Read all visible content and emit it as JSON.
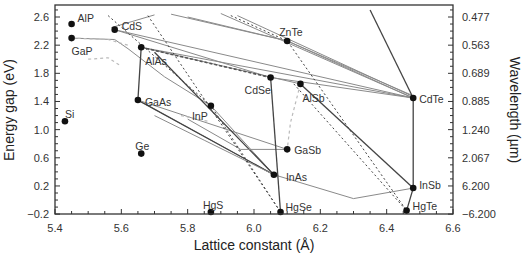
{
  "chart_data": {
    "type": "scatter",
    "title": "",
    "xlabel": "Lattice constant (Å)",
    "ylabel": "Energy gap (eV)",
    "y2label": "Wavelength (µm)",
    "xlim": [
      5.4,
      6.6
    ],
    "ylim": [
      -0.2,
      2.7
    ],
    "grid": false,
    "legend": "none",
    "x_ticks": [
      5.4,
      5.6,
      5.8,
      6.0,
      6.2,
      6.4,
      6.6
    ],
    "x_tick_labels": [
      "5.4",
      "5.6",
      "5.8",
      "6.0",
      "6.2",
      "6.4",
      "6.6"
    ],
    "y_ticks": [
      2.6,
      2.2,
      1.8,
      1.4,
      1.0,
      0.6,
      0.2,
      -0.2
    ],
    "y_tick_labels": [
      "2.6",
      "2.2",
      "1.8",
      "1.4",
      "1.0",
      "0.6",
      "0.2",
      "−0.2"
    ],
    "y2_tick_labels": [
      "0.477",
      "0.563",
      "0.689",
      "0.885",
      "1.240",
      "2.067",
      "6.200",
      "−6.200"
    ],
    "points": [
      {
        "name": "AlP",
        "x": 5.45,
        "y": 2.5,
        "lx": 6,
        "ly": -6
      },
      {
        "name": "GaP",
        "x": 5.45,
        "y": 2.3,
        "lx": 0,
        "ly": 13
      },
      {
        "name": "Si",
        "x": 5.43,
        "y": 1.12,
        "lx": 0,
        "ly": -7
      },
      {
        "name": "CdS",
        "x": 5.58,
        "y": 2.42,
        "lx": 7,
        "ly": -4
      },
      {
        "name": "AlAs",
        "x": 5.66,
        "y": 2.17,
        "lx": 4,
        "ly": 14
      },
      {
        "name": "GaAs",
        "x": 5.65,
        "y": 1.42,
        "lx": 7,
        "ly": 2
      },
      {
        "name": "Ge",
        "x": 5.66,
        "y": 0.66,
        "lx": -6,
        "ly": -8
      },
      {
        "name": "InP",
        "x": 5.87,
        "y": 1.34,
        "lx": -19,
        "ly": 10
      },
      {
        "name": "ZnTe",
        "x": 6.1,
        "y": 2.26,
        "lx": -8,
        "ly": -9
      },
      {
        "name": "CdSe",
        "x": 6.05,
        "y": 1.74,
        "lx": -26,
        "ly": 12
      },
      {
        "name": "AlSb",
        "x": 6.14,
        "y": 1.65,
        "lx": 2,
        "ly": 14
      },
      {
        "name": "CdTe",
        "x": 6.48,
        "y": 1.45,
        "lx": 6,
        "ly": 1
      },
      {
        "name": "GaSb",
        "x": 6.1,
        "y": 0.72,
        "lx": 7,
        "ly": 1
      },
      {
        "name": "InAs",
        "x": 6.06,
        "y": 0.36,
        "lx": 12,
        "ly": 2
      },
      {
        "name": "InSb",
        "x": 6.48,
        "y": 0.17,
        "lx": 6,
        "ly": -3
      },
      {
        "name": "HgS",
        "x": 5.87,
        "y": -0.17,
        "lx": -8,
        "ly": -7
      },
      {
        "name": "HgSe",
        "x": 6.08,
        "y": -0.17,
        "lx": 5,
        "ly": -5
      },
      {
        "name": "HgTe",
        "x": 6.46,
        "y": -0.15,
        "lx": 6,
        "ly": -5
      }
    ],
    "lines": [
      {
        "style": "solid-gray",
        "pts": [
          [
            5.58,
            2.42
          ],
          [
            6.05,
            1.74
          ]
        ]
      },
      {
        "style": "solid-gray",
        "pts": [
          [
            5.58,
            2.42
          ],
          [
            6.48,
            1.45
          ]
        ]
      },
      {
        "style": "solid-gray",
        "pts": [
          [
            5.57,
            2.45
          ],
          [
            5.7,
            2.63
          ]
        ]
      },
      {
        "style": "solid-gray",
        "pts": [
          [
            5.75,
            2.64
          ],
          [
            6.1,
            2.26
          ]
        ]
      },
      {
        "style": "solid-gray",
        "pts": [
          [
            5.8,
            2.6
          ],
          [
            6.1,
            2.26
          ]
        ]
      },
      {
        "style": "solid-gray",
        "pts": [
          [
            5.9,
            2.65
          ],
          [
            6.48,
            1.45
          ]
        ]
      },
      {
        "style": "solid-gray",
        "pts": [
          [
            5.95,
            2.62
          ],
          [
            6.48,
            1.47
          ]
        ]
      },
      {
        "style": "solid-gray",
        "pts": [
          [
            6.1,
            2.26
          ],
          [
            6.48,
            1.45
          ]
        ]
      },
      {
        "style": "solid-gray",
        "pts": [
          [
            6.1,
            2.26
          ],
          [
            6.48,
            1.48
          ]
        ]
      },
      {
        "style": "solid-gray",
        "pts": [
          [
            5.66,
            2.17
          ],
          [
            6.48,
            1.45
          ]
        ]
      },
      {
        "style": "solid-gray",
        "pts": [
          [
            5.66,
            2.17
          ],
          [
            6.14,
            1.65
          ]
        ]
      },
      {
        "style": "solid-gray",
        "pts": [
          [
            6.05,
            1.74
          ],
          [
            6.48,
            1.45
          ]
        ]
      },
      {
        "style": "dashed-dark",
        "pts": [
          [
            5.66,
            2.17
          ],
          [
            6.05,
            1.74
          ]
        ]
      },
      {
        "style": "solid-gray",
        "pts": [
          [
            5.45,
            2.3
          ],
          [
            5.58,
            2.28
          ],
          [
            5.62,
            2.15
          ],
          [
            5.73,
            1.75
          ],
          [
            5.87,
            1.34
          ]
        ]
      },
      {
        "style": "solid-gray",
        "pts": [
          [
            5.65,
            1.42
          ],
          [
            6.06,
            0.36
          ]
        ]
      },
      {
        "style": "solid-dark",
        "pts": [
          [
            5.65,
            1.42
          ],
          [
            6.06,
            0.36
          ]
        ]
      },
      {
        "style": "solid-dark",
        "pts": [
          [
            5.66,
            2.17
          ],
          [
            5.65,
            1.42
          ]
        ]
      },
      {
        "style": "solid-gray",
        "pts": [
          [
            5.65,
            1.42
          ],
          [
            6.1,
            0.72
          ]
        ]
      },
      {
        "style": "solid-gray",
        "pts": [
          [
            5.87,
            1.34
          ],
          [
            6.06,
            0.36
          ]
        ]
      },
      {
        "style": "solid-dark",
        "pts": [
          [
            5.7,
            2.1
          ],
          [
            6.06,
            0.36
          ]
        ]
      },
      {
        "style": "solid-gray",
        "pts": [
          [
            5.8,
            1.15
          ],
          [
            5.96,
            0.72
          ],
          [
            6.1,
            0.72
          ]
        ]
      },
      {
        "style": "solid-gray",
        "pts": [
          [
            5.7,
            1.2
          ],
          [
            5.85,
            0.85
          ],
          [
            6.06,
            0.36
          ],
          [
            6.3,
            0.02
          ],
          [
            6.48,
            0.17
          ]
        ]
      },
      {
        "style": "solid-dark",
        "pts": [
          [
            6.05,
            1.74
          ],
          [
            6.08,
            -0.17
          ]
        ]
      },
      {
        "style": "solid-dark",
        "pts": [
          [
            6.48,
            1.45
          ],
          [
            6.48,
            0.17
          ],
          [
            6.46,
            -0.15
          ]
        ]
      },
      {
        "style": "solid-dark",
        "pts": [
          [
            6.35,
            2.7
          ],
          [
            6.48,
            1.45
          ]
        ]
      },
      {
        "style": "solid-dark",
        "pts": [
          [
            6.14,
            1.65
          ],
          [
            6.48,
            0.17
          ]
        ]
      },
      {
        "style": "dotted-dark",
        "pts": [
          [
            5.68,
            2.62
          ],
          [
            6.08,
            -0.17
          ]
        ]
      },
      {
        "style": "dotted-dark",
        "pts": [
          [
            5.56,
            2.62
          ],
          [
            5.87,
            1.34
          ],
          [
            6.08,
            -0.17
          ]
        ]
      },
      {
        "style": "dotted-dark",
        "pts": [
          [
            5.93,
            2.62
          ],
          [
            6.1,
            2.26
          ],
          [
            6.46,
            -0.15
          ]
        ]
      },
      {
        "style": "dotted-dark",
        "pts": [
          [
            6.12,
            1.65
          ],
          [
            6.46,
            -0.15
          ]
        ]
      },
      {
        "style": "dotted-light",
        "pts": [
          [
            5.45,
            2.3
          ],
          [
            5.56,
            2.28
          ],
          [
            5.62,
            2.2
          ]
        ]
      },
      {
        "style": "dotted-light",
        "pts": [
          [
            5.5,
            2.0
          ],
          [
            5.56,
            2.02
          ],
          [
            5.6,
            1.9
          ]
        ]
      },
      {
        "style": "dotted-light",
        "pts": [
          [
            6.14,
            1.65
          ],
          [
            6.11,
            1.1
          ],
          [
            6.1,
            0.72
          ]
        ]
      },
      {
        "style": "dotted-light",
        "pts": [
          [
            5.78,
            1.2
          ],
          [
            5.86,
            1.12
          ]
        ]
      }
    ]
  }
}
